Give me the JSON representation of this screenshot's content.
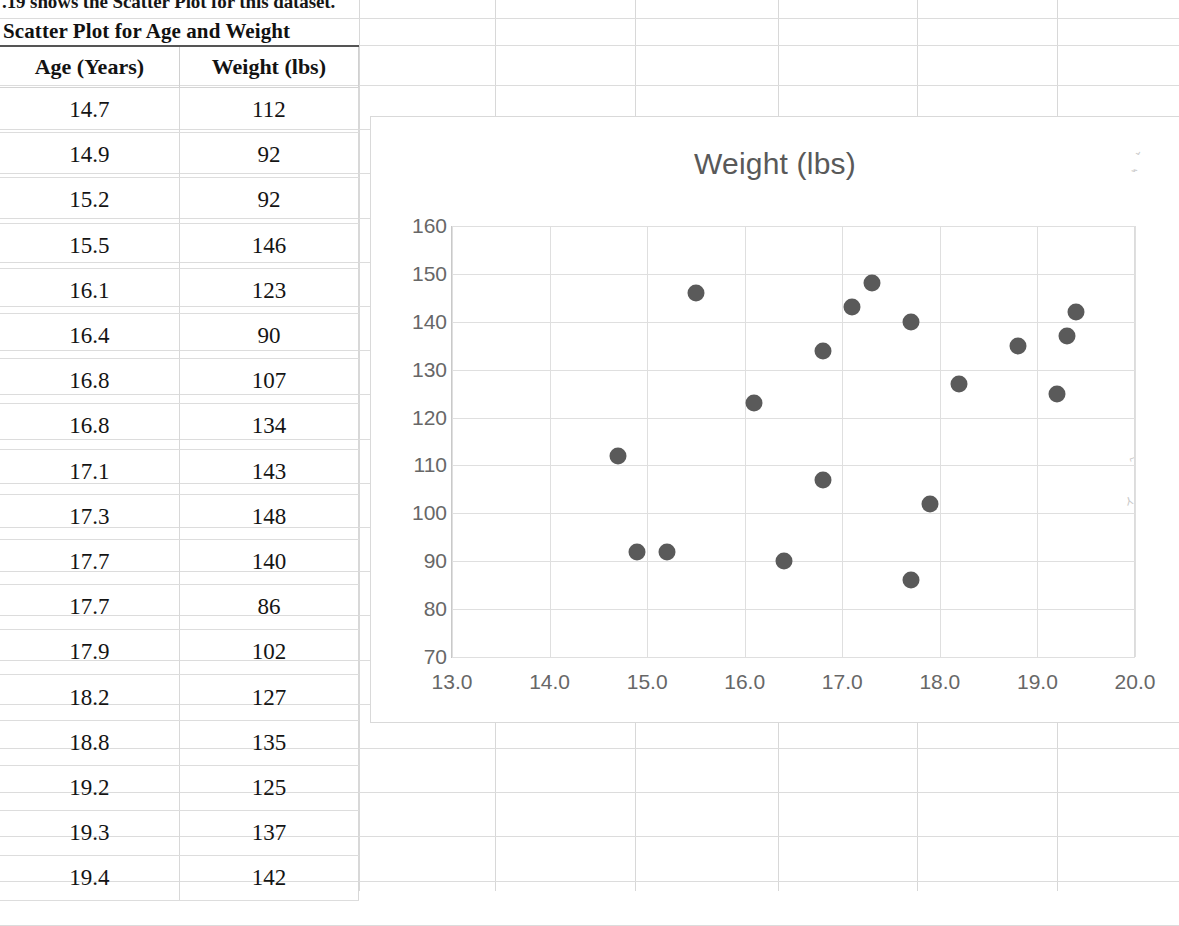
{
  "intro_text": ".19 shows the Scatter Plot for this dataset.",
  "table": {
    "title": "Scatter Plot for Age and Weight",
    "headers": [
      "Age (Years)",
      "Weight (lbs)"
    ],
    "rows": [
      [
        "14.7",
        "112"
      ],
      [
        "14.9",
        "92"
      ],
      [
        "15.2",
        "92"
      ],
      [
        "15.5",
        "146"
      ],
      [
        "16.1",
        "123"
      ],
      [
        "16.4",
        "90"
      ],
      [
        "16.8",
        "107"
      ],
      [
        "16.8",
        "134"
      ],
      [
        "17.1",
        "143"
      ],
      [
        "17.3",
        "148"
      ],
      [
        "17.7",
        "140"
      ],
      [
        "17.7",
        "86"
      ],
      [
        "17.9",
        "102"
      ],
      [
        "18.2",
        "127"
      ],
      [
        "18.8",
        "135"
      ],
      [
        "19.2",
        "125"
      ],
      [
        "19.3",
        "137"
      ],
      [
        "19.4",
        "142"
      ]
    ]
  },
  "chart_data": {
    "type": "scatter",
    "title": "Weight (lbs)",
    "xlabel": "",
    "ylabel": "",
    "xlim": [
      13.0,
      20.0
    ],
    "ylim": [
      70,
      160
    ],
    "xticks": [
      "13.0",
      "14.0",
      "15.0",
      "16.0",
      "17.0",
      "18.0",
      "19.0",
      "20.0"
    ],
    "yticks": [
      "70",
      "80",
      "90",
      "100",
      "110",
      "120",
      "130",
      "140",
      "150",
      "160"
    ],
    "grid": true,
    "legend": false,
    "marker_color": "#5a5a5a",
    "title_color": "#595959",
    "tick_color": "#676767",
    "series": [
      {
        "name": "Weight (lbs)",
        "points": [
          {
            "x": 14.7,
            "y": 112
          },
          {
            "x": 14.9,
            "y": 92
          },
          {
            "x": 15.2,
            "y": 92
          },
          {
            "x": 15.5,
            "y": 146
          },
          {
            "x": 16.1,
            "y": 123
          },
          {
            "x": 16.4,
            "y": 90
          },
          {
            "x": 16.8,
            "y": 107
          },
          {
            "x": 16.8,
            "y": 134
          },
          {
            "x": 17.1,
            "y": 143
          },
          {
            "x": 17.3,
            "y": 148
          },
          {
            "x": 17.7,
            "y": 140
          },
          {
            "x": 17.7,
            "y": 86
          },
          {
            "x": 17.9,
            "y": 102
          },
          {
            "x": 18.2,
            "y": 127
          },
          {
            "x": 18.8,
            "y": 135
          },
          {
            "x": 19.2,
            "y": 125
          },
          {
            "x": 19.3,
            "y": 137
          },
          {
            "x": 19.4,
            "y": 142
          }
        ]
      }
    ]
  }
}
